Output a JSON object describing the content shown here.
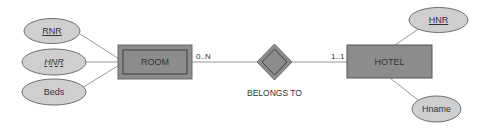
{
  "diagram": {
    "type": "er-diagram",
    "colors": {
      "entity_fill": "#8c8c8c",
      "entity_border": "#555555",
      "attribute_fill": "#cfcfcf",
      "attribute_border": "#6e6e6e",
      "line": "#9a9a9a",
      "text": "#333333"
    },
    "entities": [
      {
        "id": "room",
        "label": "ROOM",
        "weak": true
      },
      {
        "id": "hotel",
        "label": "HOTEL",
        "weak": false
      }
    ],
    "relationship": {
      "label": "BELONGS TO",
      "identifying": true
    },
    "cardinalities": {
      "room_side": "0..N",
      "hotel_side": "1..1"
    },
    "room_attributes": [
      {
        "label": "RNR",
        "style": "partial-key-underline"
      },
      {
        "label": "HNR",
        "style": "dashed-underline-italic"
      },
      {
        "label": "Beds",
        "style": "plain"
      }
    ],
    "hotel_attributes": [
      {
        "label": "HNR",
        "style": "key-underline"
      },
      {
        "label": "Hname",
        "style": "plain"
      }
    ]
  }
}
